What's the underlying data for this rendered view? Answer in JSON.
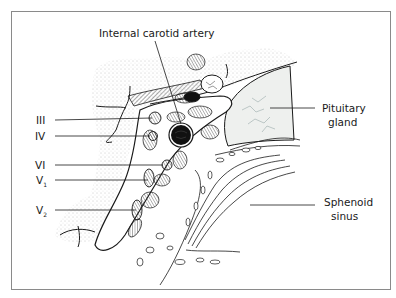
{
  "figure": {
    "labels": {
      "internal_carotid": "Internal carotid artery",
      "pituitary_line1": "Pituitary",
      "pituitary_line2": "gland",
      "sphenoid_line1": "Sphenoid",
      "sphenoid_line2": "sinus",
      "cn3": "III",
      "cn4": "IV",
      "cn6": "VI",
      "v1_main": "V",
      "v1_sub": "1",
      "v2_main": "V",
      "v2_sub": "2"
    }
  },
  "colors": {
    "ink": "#1a1a1a",
    "frame": "#8a8a8a",
    "stipple": "#9a9a9a",
    "gland_fill": "#eef0ee",
    "artery": "#111111"
  }
}
